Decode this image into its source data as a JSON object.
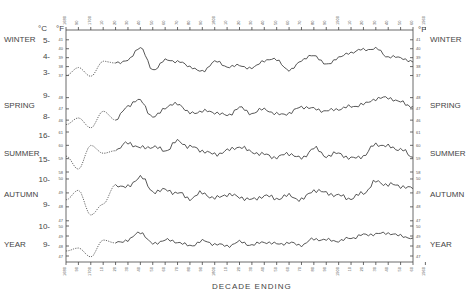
{
  "chart_data": {
    "type": "line",
    "title": "",
    "xlabel": "DECADE ENDING",
    "ylabel_left": "°C",
    "ylabel_left_secondary": "°F",
    "ylabel_right": "°F",
    "x_ticks": [
      "1680",
      "90",
      "1700",
      "10",
      "20",
      "30",
      "40",
      "50",
      "60",
      "70",
      "80",
      "90",
      "1800",
      "10",
      "20",
      "30",
      "40",
      "50",
      "60",
      "70",
      "80",
      "90",
      "1900",
      "10",
      "20",
      "30",
      "40",
      "50",
      "60",
      "1960"
    ],
    "x_range": [
      1680,
      1960
    ],
    "grid": false,
    "legend": "none (panel labels at left and right)",
    "panels": [
      {
        "name": "WINTER",
        "c_ticks": [
          "5",
          "4",
          "3"
        ],
        "f_ticks": [
          "41",
          "40",
          "39",
          "38",
          "37"
        ],
        "x": [
          1680,
          1690,
          1700,
          1710,
          1720,
          1730,
          1740,
          1750,
          1760,
          1770,
          1780,
          1790,
          1800,
          1810,
          1820,
          1830,
          1840,
          1850,
          1860,
          1870,
          1880,
          1890,
          1900,
          1910,
          1920,
          1930,
          1940,
          1950,
          1960
        ],
        "values_f": [
          37.0,
          37.9,
          36.9,
          38.6,
          38.4,
          38.7,
          40.2,
          37.6,
          38.7,
          38.6,
          38.0,
          37.4,
          38.6,
          38.0,
          38.1,
          37.8,
          38.7,
          38.8,
          37.5,
          38.7,
          39.3,
          38.2,
          39.0,
          39.6,
          39.9,
          40.0,
          39.1,
          39.0,
          38.5
        ],
        "dotted_until": 1720
      },
      {
        "name": "SPRING",
        "c_ticks": [
          "9",
          "8"
        ],
        "f_ticks": [
          "48",
          "47",
          "46"
        ],
        "x": [
          1680,
          1690,
          1700,
          1710,
          1720,
          1730,
          1740,
          1750,
          1760,
          1770,
          1780,
          1790,
          1800,
          1810,
          1820,
          1830,
          1840,
          1850,
          1860,
          1870,
          1880,
          1890,
          1900,
          1910,
          1920,
          1930,
          1940,
          1950,
          1960
        ],
        "values_f": [
          45.6,
          46.2,
          45.3,
          46.8,
          46.0,
          47.3,
          47.8,
          46.2,
          47.1,
          47.5,
          46.6,
          46.8,
          46.7,
          46.4,
          47.1,
          46.6,
          47.0,
          46.5,
          46.6,
          47.2,
          47.0,
          46.8,
          47.0,
          47.2,
          47.4,
          47.9,
          48.0,
          47.6,
          47.2
        ],
        "dotted_until": 1720
      },
      {
        "name": "SUMMER",
        "c_ticks": [
          "16",
          "15"
        ],
        "f_ticks": [
          "61",
          "60",
          "59",
          "58"
        ],
        "x": [
          1680,
          1690,
          1700,
          1710,
          1720,
          1730,
          1740,
          1750,
          1760,
          1770,
          1780,
          1790,
          1800,
          1810,
          1820,
          1830,
          1840,
          1850,
          1860,
          1870,
          1880,
          1890,
          1900,
          1910,
          1920,
          1930,
          1940,
          1950,
          1960
        ],
        "values_f": [
          59.2,
          58.2,
          60.0,
          59.4,
          59.6,
          60.2,
          59.8,
          59.9,
          59.6,
          60.3,
          59.9,
          59.6,
          59.3,
          59.6,
          59.9,
          59.5,
          59.3,
          59.1,
          59.4,
          59.0,
          59.8,
          59.2,
          59.4,
          59.0,
          59.2,
          60.1,
          59.9,
          59.7,
          59.1
        ],
        "dotted_until": 1720
      },
      {
        "name": "AUTUMN",
        "c_ticks": [
          "10",
          "9"
        ],
        "f_ticks": [
          "50",
          "49",
          "48",
          "47"
        ],
        "x": [
          1680,
          1690,
          1700,
          1710,
          1720,
          1730,
          1740,
          1750,
          1760,
          1770,
          1780,
          1790,
          1800,
          1810,
          1820,
          1830,
          1840,
          1850,
          1860,
          1870,
          1880,
          1890,
          1900,
          1910,
          1920,
          1930,
          1940,
          1950,
          1960
        ],
        "values_f": [
          48.5,
          49.2,
          47.4,
          48.2,
          49.6,
          49.4,
          50.2,
          49.1,
          49.2,
          49.0,
          48.6,
          49.0,
          48.6,
          48.9,
          48.7,
          48.5,
          48.8,
          48.6,
          48.8,
          48.5,
          49.2,
          49.0,
          48.8,
          48.6,
          49.0,
          49.8,
          49.6,
          49.5,
          49.3
        ],
        "dotted_until": 1720
      },
      {
        "name": "YEAR",
        "c_ticks": [
          "10",
          "9"
        ],
        "f_ticks": [
          "50",
          "49",
          "48",
          "47"
        ],
        "x": [
          1680,
          1690,
          1700,
          1710,
          1720,
          1730,
          1740,
          1750,
          1760,
          1770,
          1780,
          1790,
          1800,
          1810,
          1820,
          1830,
          1840,
          1850,
          1860,
          1870,
          1880,
          1890,
          1900,
          1910,
          1920,
          1930,
          1940,
          1950,
          1960
        ],
        "values_f": [
          47.5,
          47.8,
          46.9,
          48.6,
          48.3,
          48.6,
          49.4,
          48.2,
          48.6,
          48.4,
          48.0,
          48.5,
          48.2,
          48.0,
          48.4,
          48.1,
          48.4,
          48.2,
          48.3,
          48.1,
          48.7,
          48.6,
          48.5,
          48.8,
          49.1,
          49.2,
          49.3,
          49.0,
          48.8
        ],
        "dotted_until": 1720
      }
    ]
  },
  "labels": {
    "xlabel": "DECADE ENDING",
    "unit_c": "°C",
    "unit_f": "°F",
    "unit_f_right": "°F"
  }
}
